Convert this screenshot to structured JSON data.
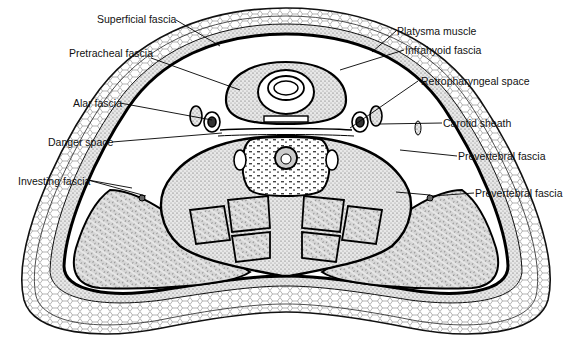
{
  "diagram": {
    "type": "anatomical-cross-section"
  },
  "labels": {
    "superficial_fascia": "Superficial fascia",
    "pretracheal_fascia": "Pretracheal fascia",
    "alar_fascia": "Alar fascia",
    "danger_space": "Danger space",
    "investing_fascia": "Investing fascia",
    "platysma_muscle": "Platysma muscle",
    "infrahyoid_fascia": "Infrahyoid fascia",
    "retropharyngeal_space": "Retropharyngeal space",
    "carotid_sheath": "Carotid sheath",
    "prevertebral_fascia_1": "Prevertebral fascia",
    "prevertebral_fascia_2": "Prevertebral fascia"
  }
}
